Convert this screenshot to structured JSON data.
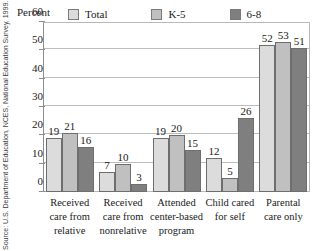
{
  "figure": {
    "source_note": "Source: U.S. Department of Education, NCES, National Education Survey, 1999."
  },
  "chart_data": {
    "type": "bar",
    "title": "",
    "subtitle": "",
    "xlabel": "",
    "ylabel": "Percent",
    "ylim": [
      0,
      60
    ],
    "yticks": [
      0,
      10,
      20,
      30,
      40,
      50,
      60
    ],
    "ytick_labels": [
      "0",
      "10",
      "20",
      "30",
      "40",
      "50",
      "60"
    ],
    "grid": true,
    "grid_axis": "y",
    "legend_position": "top",
    "categories": [
      "Received care from relative",
      "Received care from nonrelative",
      "Attended center-based program",
      "Child cared for self",
      "Parental care only"
    ],
    "category_lines": [
      [
        "Received",
        "care from",
        "relative"
      ],
      [
        "Received",
        "care from",
        "nonrelative"
      ],
      [
        "Attended",
        "center-based",
        "program"
      ],
      [
        "Child cared",
        "for self",
        ""
      ],
      [
        "Parental",
        "care only",
        ""
      ]
    ],
    "series": [
      {
        "name": "Total",
        "color": "#dcdcdc",
        "values": [
          19,
          7,
          19,
          12,
          52
        ]
      },
      {
        "name": "K-5",
        "color": "#c0c0c0",
        "values": [
          21,
          10,
          20,
          5,
          53
        ]
      },
      {
        "name": "6-8",
        "color": "#7f7f7f",
        "values": [
          16,
          3,
          15,
          26,
          51
        ]
      }
    ],
    "data_labels": [
      [
        "19",
        "21",
        "16"
      ],
      [
        "7",
        "10",
        "3"
      ],
      [
        "19",
        "20",
        "15"
      ],
      [
        "12",
        "5",
        "26"
      ],
      [
        "52",
        "53",
        "51"
      ]
    ]
  },
  "colors": {
    "total": "#dcdcdc",
    "k5": "#c0c0c0",
    "grade68": "#7f7f7f",
    "bar_outline": "#6e6e6e",
    "gridline": "#bdbdbd",
    "axis": "#8d8d8d",
    "text": "#1a1a1a",
    "background": "#ffffff"
  }
}
